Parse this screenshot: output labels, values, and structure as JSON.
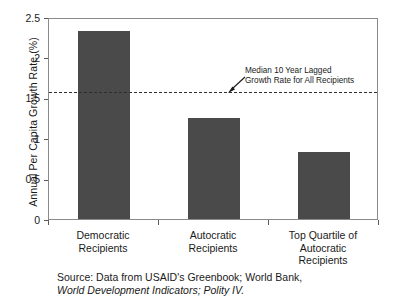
{
  "chart_data": {
    "type": "bar",
    "title": "",
    "xlabel": "",
    "ylabel": "Annual Per Capita Growth Rate (%)",
    "categories": [
      "Democratic\nRecipients",
      "Autocratic\nRecipients",
      "Top Quartile of\nAutocratic\nRecipients"
    ],
    "category_lines": [
      [
        "Democratic",
        "Recipients"
      ],
      [
        "Autocratic",
        "Recipients"
      ],
      [
        "Top Quartile of",
        "Autocratic",
        "Recipients"
      ]
    ],
    "values": [
      2.33,
      1.25,
      0.83
    ],
    "ylim": [
      0,
      2.5
    ],
    "yticks": [
      0,
      0.5,
      1,
      1.5,
      2,
      2.5
    ],
    "ytick_labels": [
      "0",
      "0.5",
      "1",
      "1.5",
      "2",
      "2.5"
    ],
    "grid": false,
    "legend": "none",
    "bar_color": "#4a4a4a",
    "reference_line": {
      "value": 1.6,
      "style": "dashed",
      "color": "#2e2e2e",
      "label_lines": [
        "Median 10 Year Lagged",
        "Growth Rate for All Recipients"
      ]
    },
    "annotations": [
      {
        "text": "Median 10 Year Lagged Growth Rate for All Recipients",
        "points_to": "reference-line"
      }
    ]
  },
  "source": {
    "line1": "Source: Data from USAID's Greenbook; World Bank,",
    "line2": "World Development Indicators; Polity IV."
  }
}
